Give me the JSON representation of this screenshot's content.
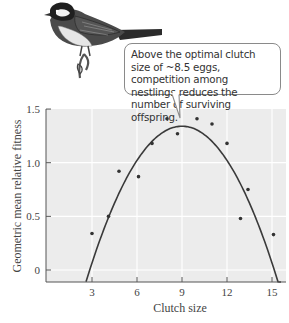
{
  "callout": {
    "text": "Above the optimal clutch size of ~8.5 eggs, competition among nestlings reduces the number of surviving offspring."
  },
  "illustration": {
    "subject": "bird-on-branch"
  },
  "colors": {
    "plot_background": "#ececec",
    "gridline": "#ffffff",
    "curve": "#3a3a3a",
    "points": "#333333",
    "axis": "#555555"
  },
  "chart_data": {
    "type": "scatter",
    "title": "",
    "xlabel": "Clutch size",
    "ylabel": "Geometric mean relative fitness",
    "xlim": [
      0,
      15.9
    ],
    "ylim": [
      -0.11,
      1.5
    ],
    "xticks": [
      3,
      6,
      9,
      12,
      15
    ],
    "yticks": [
      0,
      0.5,
      1.0,
      1.5
    ],
    "xtick_labels": [
      "3",
      "6",
      "9",
      "12",
      "15"
    ],
    "ytick_labels": [
      "0",
      "0.5",
      "1.0",
      "1.5"
    ],
    "grid": true,
    "legend": null,
    "series": [
      {
        "name": "observed",
        "kind": "scatter",
        "points": [
          {
            "x": 3.0,
            "y": 0.34
          },
          {
            "x": 4.1,
            "y": 0.5
          },
          {
            "x": 4.8,
            "y": 0.92
          },
          {
            "x": 6.1,
            "y": 0.87
          },
          {
            "x": 7.0,
            "y": 1.18
          },
          {
            "x": 8.0,
            "y": 1.41
          },
          {
            "x": 8.7,
            "y": 1.27
          },
          {
            "x": 10.0,
            "y": 1.41
          },
          {
            "x": 11.0,
            "y": 1.36
          },
          {
            "x": 12.0,
            "y": 1.18
          },
          {
            "x": 12.9,
            "y": 0.48
          },
          {
            "x": 13.4,
            "y": 0.75
          },
          {
            "x": 15.1,
            "y": 0.33
          }
        ]
      },
      {
        "name": "fitted quadratic",
        "kind": "line",
        "peak": {
          "x": 9.0,
          "y": 1.34
        },
        "curvature": 0.0354,
        "x_range": [
          2.6,
          15.6
        ]
      }
    ],
    "annotation": "Above the optimal clutch size of ~8.5 eggs, competition among nestlings reduces the number of surviving offspring."
  },
  "labels": {
    "xlabel": "Clutch size",
    "ylabel": "Geometric mean relative fitness",
    "xticks": [
      "3",
      "6",
      "9",
      "12",
      "15"
    ],
    "yticks": [
      "0",
      "0.5",
      "1.0",
      "1.5"
    ]
  }
}
